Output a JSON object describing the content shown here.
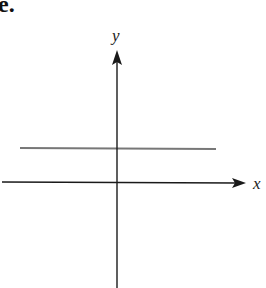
{
  "part_label": "e.",
  "axes": {
    "x_label": "x",
    "y_label": "y",
    "axis_color": "#1a1a1a"
  },
  "graph": {
    "description": "horizontal line above the x-axis (constant function y = c, c > 0)",
    "line_color": "#7a7a7a"
  }
}
